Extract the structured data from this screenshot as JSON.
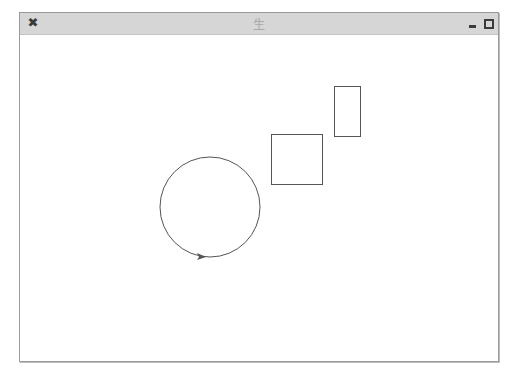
{
  "window": {
    "title": "生",
    "controls": {
      "close_glyph": "✖",
      "minimize_icon": "minimize-icon",
      "maximize_icon": "maximize-icon"
    }
  },
  "canvas": {
    "background": "#ffffff",
    "stroke_color": "#555555",
    "shapes": [
      {
        "type": "circle",
        "cx": 210,
        "cy": 207,
        "r": 50,
        "direction_arrow": "right"
      },
      {
        "type": "rect",
        "x": 271,
        "y": 134,
        "width": 51,
        "height": 50
      },
      {
        "type": "rect",
        "x": 334,
        "y": 86,
        "width": 26,
        "height": 50
      }
    ]
  }
}
